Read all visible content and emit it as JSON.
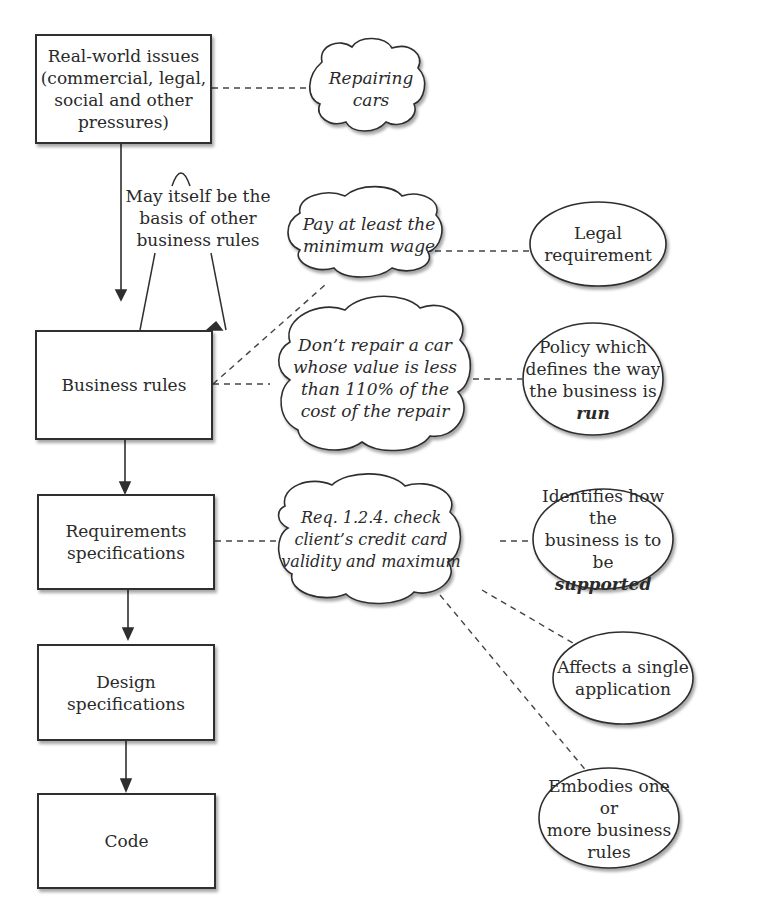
{
  "diagram": {
    "type": "business-rules-context-flow",
    "colors": {
      "stroke": "#2f2f2f",
      "text": "#2a2a2a",
      "background": "#ffffff",
      "dashed": "#444444"
    },
    "main_flow": [
      {
        "id": "real_world",
        "label": "Real-world issues\n(commercial, legal,\nsocial and other\npressures)"
      },
      {
        "id": "business_rules",
        "label": "Business rules"
      },
      {
        "id": "requirements",
        "label": "Requirements\nspecifications"
      },
      {
        "id": "design",
        "label": "Design\nspecifications"
      },
      {
        "id": "code",
        "label": "Code"
      }
    ],
    "self_loop_note": "May itself be the\nbasis of other\nbusiness rules",
    "examples": {
      "repairing_cars": "Repairing\ncars",
      "min_wage": "Pay at least the\nminimum wage",
      "dont_repair": "Don’t repair a car\nwhose value is less\nthan 110% of the\ncost of the repair",
      "req_124": "Req. 1.2.4. check\nclient’s credit card\nvalidity and maximum"
    },
    "explanations": {
      "legal": {
        "text": "Legal requirement"
      },
      "policy": {
        "text": "Policy which\ndefines the way\nthe business is",
        "emphasis": "run"
      },
      "identifies": {
        "text": "Identifies how the\nbusiness is to be",
        "emphasis": "supported"
      },
      "single_app": {
        "text": "Affects a single\napplication"
      },
      "embodies": {
        "text": "Embodies one or\nmore business\nrules"
      }
    }
  }
}
